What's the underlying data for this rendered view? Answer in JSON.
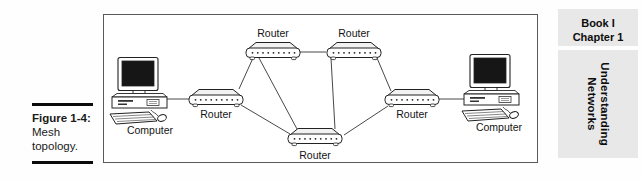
{
  "figure_caption": {
    "label": "Figure 1-4:",
    "line1": "Mesh",
    "line2": "topology."
  },
  "sidebar": {
    "book": "Book I",
    "chapter": "Chapter 1",
    "section_line1": "Understanding",
    "section_line2": "Networks"
  },
  "diagram": {
    "nodes": {
      "computer_left": "Computer",
      "router_left": "Router",
      "router_top_left": "Router",
      "router_top_right": "Router",
      "router_right": "Router",
      "router_bottom": "Router",
      "computer_right": "Computer"
    },
    "connections": [
      "computer_left-router_left",
      "router_left-router_top_left",
      "router_left-router_bottom",
      "router_top_left-router_top_right",
      "router_top_left-router_bottom",
      "router_top_right-router_bottom",
      "router_top_right-router_right",
      "router_right-router_bottom",
      "router_right-computer_right"
    ],
    "colors": {
      "line": "#333333",
      "outline": "#222222",
      "screen": "#161616",
      "sidebar_bg": "#e8e8e8",
      "rule": "#0b0b0b"
    }
  }
}
